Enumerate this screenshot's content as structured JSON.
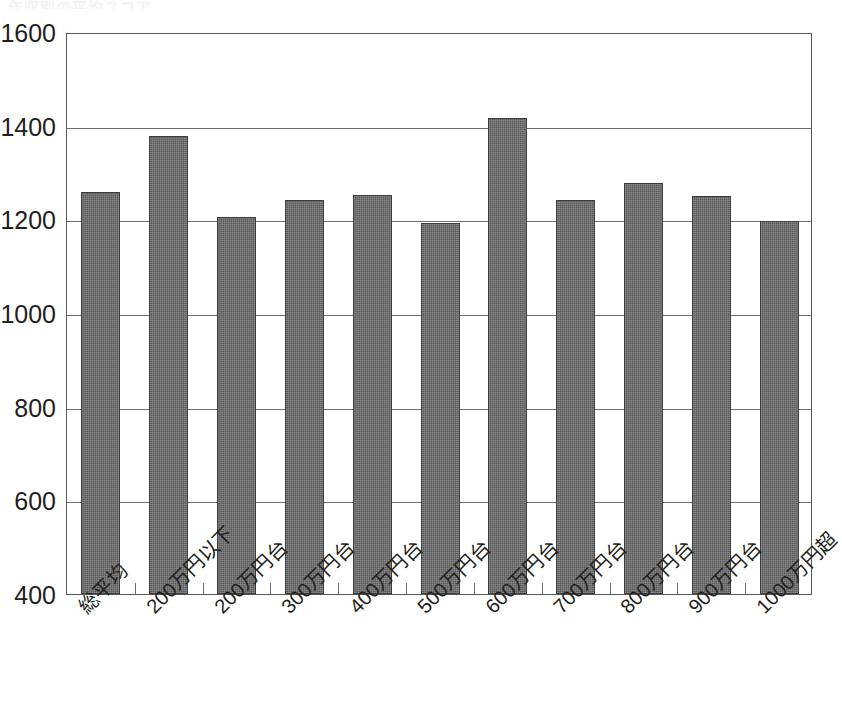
{
  "title_remnant": "年収別の平均スコア",
  "chart_data": {
    "type": "bar",
    "title": "",
    "xlabel": "",
    "ylabel": "",
    "ylim": [
      400,
      1600
    ],
    "yticks": [
      1600,
      1400,
      1200,
      1000,
      800,
      600,
      400
    ],
    "grid": true,
    "legend": "none",
    "categories": [
      "総平均",
      "200万円以下",
      "200万円台",
      "300万円台",
      "400万円台",
      "500万円台",
      "600万円台",
      "700万円台",
      "800万円台",
      "900万円台",
      "1000万円超"
    ],
    "values": [
      1258,
      1378,
      1205,
      1242,
      1252,
      1193,
      1417,
      1242,
      1278,
      1249,
      1197
    ],
    "bar_color": "#575757",
    "axis_color": "#58585a",
    "grid_color": "#6d6e70"
  }
}
